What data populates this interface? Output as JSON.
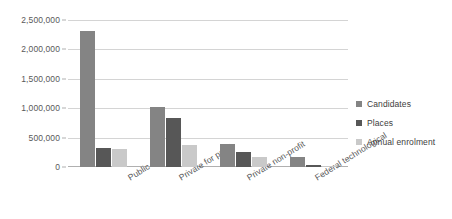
{
  "chart_data": {
    "type": "bar",
    "title": "",
    "xlabel": "",
    "ylabel": "",
    "ylim": [
      0,
      2500000
    ],
    "ytick_step": 500000,
    "ytick_labels": [
      "0",
      "500,000",
      "1,000,000",
      "1,500,000",
      "2,000,000",
      "2,500,000"
    ],
    "grid": "horizontal",
    "legend_position": "right",
    "categories": [
      "Public",
      "Private for profit",
      "Private non-profit",
      "Federal technological"
    ],
    "series": [
      {
        "name": "Candidates",
        "color": "#848484",
        "values": [
          2320000,
          1020000,
          390000,
          165000
        ]
      },
      {
        "name": "Places",
        "color": "#575757",
        "values": [
          320000,
          830000,
          255000,
          35000
        ]
      },
      {
        "name": "Annual enrolment",
        "color": "#c9c9c9",
        "values": [
          310000,
          370000,
          165000,
          25000
        ]
      }
    ]
  },
  "legend": {
    "items": [
      {
        "label": "Candidates"
      },
      {
        "label": "Places"
      },
      {
        "label": "Annual enrolment"
      }
    ]
  }
}
